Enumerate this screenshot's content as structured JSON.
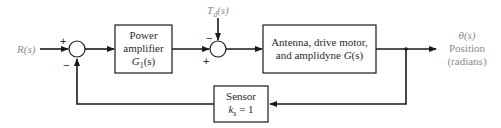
{
  "diagram": {
    "type": "feedback-control-block-diagram",
    "input": {
      "label": "R(s)"
    },
    "disturbance": {
      "label": "T_d(s)",
      "symbol": "T",
      "subscript": "d",
      "arg": "(s)"
    },
    "output": {
      "symbol": "θ(s)",
      "line1": "Position",
      "line2": "(radians)"
    },
    "summing_junctions": [
      {
        "id": "sum1",
        "signs": {
          "input": "+",
          "feedback": "−"
        }
      },
      {
        "id": "sum2",
        "signs": {
          "disturbance": "−",
          "forward": "+"
        }
      }
    ],
    "blocks": [
      {
        "id": "power-amplifier",
        "line1": "Power",
        "line2": "amplifier",
        "tf_symbol": "G",
        "tf_sub": "1",
        "tf_arg": "(s)"
      },
      {
        "id": "plant",
        "line1": "Antenna, drive motor,",
        "line2_text": "and amplidyne ",
        "tf_symbol": "G",
        "tf_arg": "(s)"
      },
      {
        "id": "sensor",
        "line1": "Sensor",
        "gain_symbol": "k",
        "gain_sub": "s",
        "gain_value": " = 1"
      }
    ],
    "colors": {
      "line": "#1a1a1a",
      "text": "#2a2a2a",
      "output_text": "#8a8a8a",
      "background": "#ffffff"
    }
  }
}
